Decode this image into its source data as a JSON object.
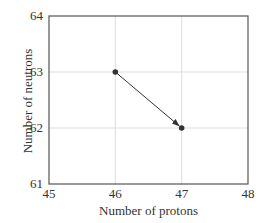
{
  "chart_data": {
    "type": "scatter",
    "title": "",
    "xlabel": "Number of protons",
    "ylabel": "Number of neutrons",
    "xlim": [
      45,
      48
    ],
    "ylim": [
      61,
      64
    ],
    "x_ticks": [
      "45",
      "46",
      "47",
      "48"
    ],
    "y_ticks": [
      "61",
      "62",
      "63",
      "64"
    ],
    "grid": true,
    "legend": null,
    "series": [
      {
        "name": "decay",
        "points": [
          {
            "x": 46,
            "y": 63
          },
          {
            "x": 47,
            "y": 62
          }
        ]
      }
    ],
    "annotations": [
      {
        "type": "arrow",
        "from": {
          "x": 46,
          "y": 63
        },
        "to": {
          "x": 47,
          "y": 62
        }
      }
    ]
  },
  "colors": {
    "axis": "#555555",
    "grid": "#dddddd",
    "point": "#333333",
    "arrow": "#333333",
    "text": "#333333"
  }
}
